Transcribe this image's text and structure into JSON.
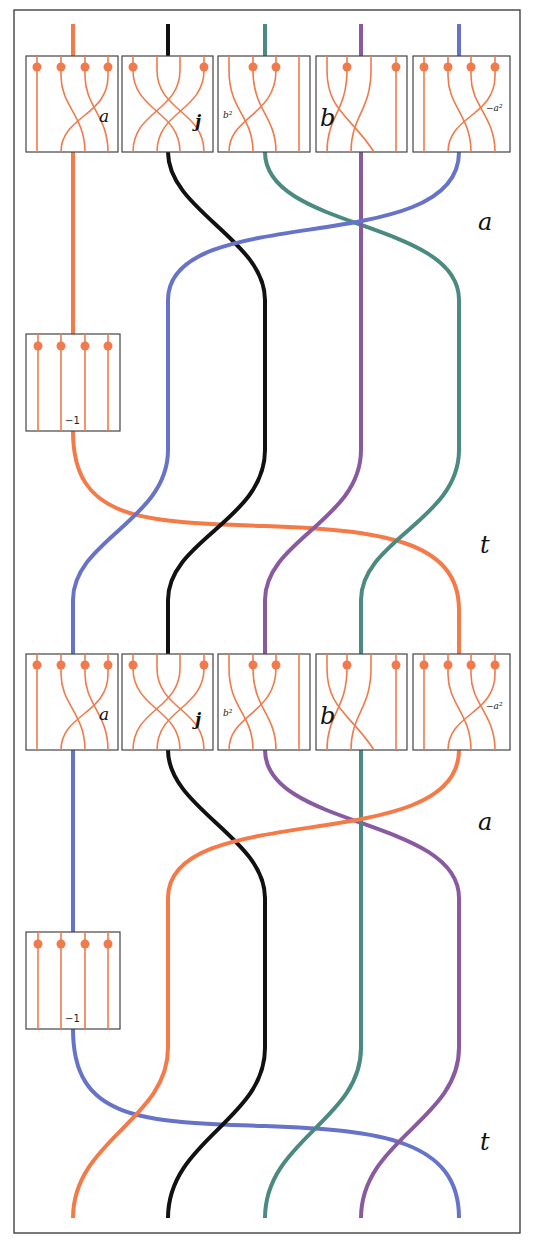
{
  "diagram": {
    "colors": {
      "orange": "#f47a48",
      "black": "#111111",
      "teal": "#4a8a80",
      "purple": "#8a5aa0",
      "blue": "#6673c8",
      "box_strand": "#f07a4c",
      "frame": "#333333"
    },
    "strand_order_top": [
      "orange",
      "black",
      "teal",
      "purple",
      "blue"
    ],
    "strand_order_middle": [
      "blue",
      "black",
      "purple",
      "teal",
      "orange"
    ],
    "strand_order_bottom": [
      "orange",
      "black",
      "teal",
      "purple",
      "blue"
    ],
    "row1_boxes": [
      {
        "label": "a",
        "dots": [
          1,
          2,
          3,
          4
        ]
      },
      {
        "label": "j",
        "dots": [
          1,
          4
        ]
      },
      {
        "label": "b²",
        "dots": [
          2,
          3
        ]
      },
      {
        "label": "b",
        "dots": [
          2,
          4
        ]
      },
      {
        "label": "−a²",
        "dots": [
          1,
          2,
          3,
          4
        ]
      }
    ],
    "row2_boxes": [
      {
        "label": "a",
        "dots": [
          1,
          2,
          3,
          4
        ]
      },
      {
        "label": "j",
        "dots": [
          1,
          4
        ]
      },
      {
        "label": "b²",
        "dots": [
          2,
          3
        ]
      },
      {
        "label": "b",
        "dots": [
          2,
          4
        ]
      },
      {
        "label": "−a²",
        "dots": [
          1,
          2,
          3,
          4
        ]
      }
    ],
    "scalar_boxes": [
      {
        "label": "−1",
        "dots": [
          1,
          2,
          3,
          4
        ]
      },
      {
        "label": "−1",
        "dots": [
          1,
          2,
          3,
          4
        ]
      }
    ],
    "side_labels": [
      "a",
      "t",
      "a",
      "t"
    ]
  }
}
